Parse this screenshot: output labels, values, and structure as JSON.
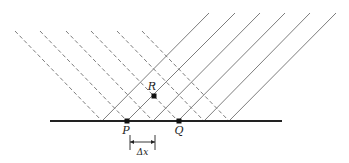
{
  "diagram": {
    "colors": {
      "background": "#ffffff",
      "base_line": "#222222",
      "rays": "#6e6e6e",
      "points": "#111111"
    },
    "base_line": {
      "y": 121,
      "x1": 50,
      "x2": 282
    },
    "incident_rays_dashed": {
      "top_y": 31,
      "top_x": [
        15,
        40,
        66,
        91,
        117,
        142
      ],
      "base_x": [
        102,
        127,
        153,
        178,
        204,
        229
      ]
    },
    "reflected_rays_solid": {
      "top_y": 13,
      "top_x": [
        209,
        235,
        260,
        285,
        310,
        336
      ],
      "base_x": [
        102,
        127,
        153,
        178,
        204,
        229
      ]
    },
    "points": [
      {
        "name": "P",
        "label": "P",
        "x": 127,
        "y": 121
      },
      {
        "name": "Q",
        "label": "Q",
        "x": 179,
        "y": 121
      },
      {
        "name": "R",
        "label": "R",
        "x": 154,
        "y": 96
      }
    ],
    "dimension": {
      "label": "Δx",
      "x1": 130,
      "x2": 155,
      "y": 145
    }
  }
}
